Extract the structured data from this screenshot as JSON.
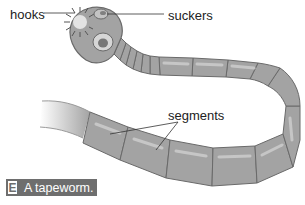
{
  "figure": {
    "subject": "tapeworm",
    "labels": {
      "hooks": "hooks",
      "suckers": "suckers",
      "segments": "segments"
    },
    "caption": {
      "letter": "E",
      "text": "A tapeworm."
    },
    "colors": {
      "body_fill": "#a3a3a3",
      "body_stroke": "#6a6a6a",
      "highlight": "#c9c9c9",
      "caption_bg": "#6e6e6e",
      "caption_text": "#ffffff"
    }
  }
}
